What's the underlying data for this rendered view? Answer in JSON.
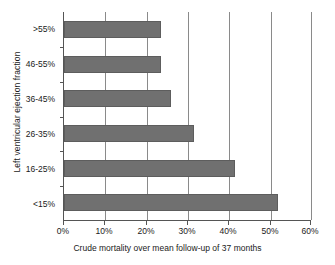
{
  "chart_data": {
    "type": "bar",
    "orientation": "horizontal",
    "title": "",
    "xlabel": "Crude mortality over mean follow-up of 37 months",
    "ylabel": "Left ventricular ejection fraction",
    "categories": [
      ">55%",
      "46-55%",
      "36-45%",
      "26-35%",
      "16-25%",
      "<15%"
    ],
    "values": [
      23.5,
      23.5,
      26,
      31.5,
      41.5,
      52
    ],
    "value_unit": "%",
    "xlim": [
      0,
      60
    ],
    "xticks": [
      0,
      10,
      20,
      30,
      40,
      50,
      60
    ],
    "xtick_labels": [
      "0%",
      "10%",
      "20%",
      "30%",
      "40%",
      "50%",
      "60%"
    ],
    "grid": "vertical",
    "legend": "none",
    "series": [
      {
        "name": "Crude mortality",
        "values": [
          23.5,
          23.5,
          26,
          31.5,
          41.5,
          52
        ]
      }
    ],
    "colors": {
      "bar_fill": "#707070",
      "bar_edge": "#5d5d5d",
      "gridline": "#8a8a8a",
      "axis": "#555555",
      "background": "#ffffff",
      "text": "#1a1a1a"
    }
  }
}
